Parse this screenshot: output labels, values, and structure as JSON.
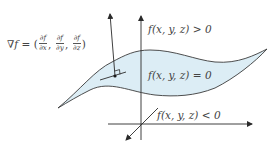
{
  "diagram": {
    "gradient_label": {
      "nabla": "∇",
      "f": "f",
      "equals": " = (",
      "partials": [
        {
          "num": "∂f",
          "den": "∂x"
        },
        {
          "num": "∂f",
          "den": "∂y"
        },
        {
          "num": "∂f",
          "den": "∂z"
        }
      ],
      "sep": ", ",
      "close": ")"
    },
    "labels": {
      "positive_region": "f(x, y, z) > 0",
      "level_surface": "f(x, y, z) = 0",
      "negative_region": "f(x, y, z) < 0"
    },
    "colors": {
      "surface_fill": "#dcedf5",
      "stroke": "#3a3a3a",
      "text": "#444444"
    },
    "elements": [
      "level surface f(x,y,z)=0 (shaded sheet)",
      "gradient vector perpendicular to surface at a point",
      "tangent line with right-angle marker",
      "3D coordinate axes"
    ]
  }
}
